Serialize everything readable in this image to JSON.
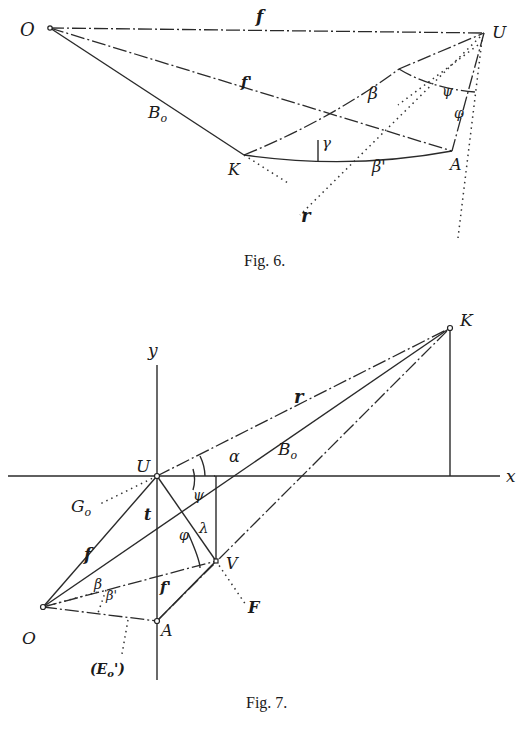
{
  "figures": [
    {
      "caption": "Fig. 6.",
      "points": {
        "O": "O",
        "U": "U",
        "K": "K",
        "A": "A"
      },
      "labels": {
        "f": "f",
        "f_prime": "f'",
        "B0": "B",
        "B0_sub": "o",
        "beta": "β",
        "beta_prime": "β'",
        "gamma": "γ",
        "psi": "ψ",
        "phi": "φ",
        "r": "r"
      }
    },
    {
      "caption": "Fig. 7.",
      "axes": {
        "x": "x",
        "y": "y"
      },
      "points": {
        "U": "U",
        "K": "K",
        "V": "V",
        "O": "O",
        "A": "A"
      },
      "labels": {
        "r": "r",
        "alpha": "α",
        "B0": "B",
        "B0_sub": "o",
        "G0": "G",
        "G0_sub": "o",
        "t": "t",
        "psi": "ψ",
        "phi": "φ",
        "lambda": "λ",
        "f": "f",
        "f_prime": "f'",
        "beta": "β",
        "beta_prime": "β'",
        "F": "F",
        "E0": "(E",
        "E0_sub": "o",
        "E0_close": "')"
      }
    }
  ]
}
